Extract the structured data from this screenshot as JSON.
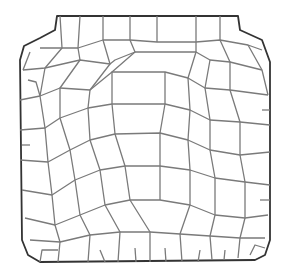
{
  "image": {
    "description": "Line drawing of polygonal cell network (epidermal cells) within a rounded-square outline",
    "colors": {
      "background": "#ffffff",
      "cell_wall": "#7a7a7a",
      "outline": "#333333"
    }
  }
}
